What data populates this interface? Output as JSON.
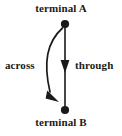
{
  "diagram": {
    "background_color": "#ffffff",
    "ink_color": "#1a1a1a",
    "nodes": [
      {
        "id": "terminal-a",
        "label": "terminal A",
        "x": 65,
        "y": 24,
        "radius": 4,
        "label_position": "above"
      },
      {
        "id": "terminal-b",
        "label": "terminal B",
        "x": 65,
        "y": 110,
        "radius": 4,
        "label_position": "below"
      }
    ],
    "arrows": [
      {
        "id": "through-arrow",
        "label": "through",
        "shape": "straight",
        "from": "terminal-a",
        "to": "terminal-b",
        "direction": "down",
        "arrowhead_at": {
          "x": 65,
          "y": 70
        },
        "label_x": 75,
        "label_y": 60
      },
      {
        "id": "across-arrow",
        "label": "across",
        "shape": "curved",
        "from": "terminal-a",
        "to": "terminal-b",
        "bow": "left",
        "direction": "down",
        "arrowhead_at": {
          "x": 58,
          "y": 100
        },
        "label_x": 5,
        "label_y": 60
      }
    ]
  }
}
